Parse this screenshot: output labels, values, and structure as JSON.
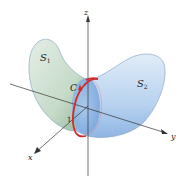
{
  "diagram": {
    "type": "3d-surface-illustration",
    "axes": {
      "x_label": "x",
      "y_label": "y",
      "z_label": "z",
      "tick_label": "1"
    },
    "surfaces": [
      {
        "name": "S",
        "subscript": "1",
        "color": "#c9dccd"
      },
      {
        "name": "S",
        "subscript": "2",
        "color": "#b9d3ee"
      }
    ],
    "curve": {
      "label": "C",
      "color": "#d02a2a"
    },
    "colors": {
      "surface1_fill": "#cfe0d2",
      "surface1_shade": "#9fbfa6",
      "surface2_fill": "#c4dbf3",
      "surface2_shade": "#8fb6e3",
      "outline": "#7a9cc0",
      "axis": "#333333"
    }
  }
}
